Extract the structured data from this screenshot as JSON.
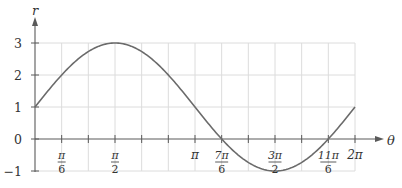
{
  "chart_data": {
    "type": "line",
    "title": "",
    "equation": "r = 1 + 2 sin θ",
    "xlabel": "θ",
    "ylabel": "r",
    "xlim": [
      0,
      6.2832
    ],
    "ylim": [
      -1,
      3
    ],
    "grid": true,
    "x_grid_step": "π/6",
    "y_ticks": [
      {
        "value": 3,
        "label": "3"
      },
      {
        "value": 2,
        "label": "2"
      },
      {
        "value": 1,
        "label": "1"
      },
      {
        "value": 0,
        "label": "0"
      },
      {
        "value": -1,
        "label": "−1"
      }
    ],
    "x_ticks": [
      {
        "value": 0.5236,
        "num": "π",
        "den": "6"
      },
      {
        "value": 1.5708,
        "num": "π",
        "den": "2"
      },
      {
        "value": 3.1416,
        "num": "π",
        "den": ""
      },
      {
        "value": 3.6652,
        "num": "7π",
        "den": "6"
      },
      {
        "value": 4.7124,
        "num": "3π",
        "den": "2"
      },
      {
        "value": 5.7596,
        "num": "11π",
        "den": "6"
      },
      {
        "value": 6.2832,
        "num": "2π",
        "den": ""
      }
    ],
    "series": [
      {
        "name": "r = 1 + 2 sin θ",
        "x": [
          0,
          0.5236,
          1.0472,
          1.5708,
          2.0944,
          2.618,
          3.1416,
          3.6652,
          4.1888,
          4.7124,
          5.236,
          5.7596,
          6.2832
        ],
        "values": [
          1,
          2,
          2.732,
          3,
          2.732,
          2,
          1,
          0,
          -0.732,
          -1,
          -0.732,
          0,
          1
        ]
      }
    ],
    "colors": {
      "curve": "#6b6b6b",
      "axis": "#5a5a5a",
      "grid": "#dcdcdc"
    }
  }
}
